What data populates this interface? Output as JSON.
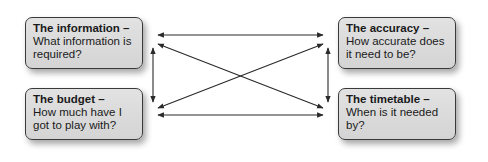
{
  "diagram": {
    "boxes": [
      {
        "id": "information",
        "title": "The information –",
        "body": "What information is required?"
      },
      {
        "id": "accuracy",
        "title": "The accuracy –",
        "body": "How accurate does it need to be?"
      },
      {
        "id": "budget",
        "title": "The budget –",
        "body": "How much have I got to play with?"
      },
      {
        "id": "timetable",
        "title": "The timetable –",
        "body": "When is it needed by?"
      }
    ],
    "connections": [
      {
        "from": "information",
        "to": "accuracy",
        "type": "bidirectional"
      },
      {
        "from": "budget",
        "to": "timetable",
        "type": "bidirectional"
      },
      {
        "from": "information",
        "to": "budget",
        "type": "bidirectional"
      },
      {
        "from": "accuracy",
        "to": "timetable",
        "type": "bidirectional"
      },
      {
        "from": "information",
        "to": "timetable",
        "type": "bidirectional"
      },
      {
        "from": "budget",
        "to": "accuracy",
        "type": "bidirectional"
      }
    ],
    "colors": {
      "box_fill": "#d9d9d9",
      "box_border": "#3a3a3a",
      "arrow": "#2a2a2a",
      "text": "#1a1a1a"
    }
  }
}
